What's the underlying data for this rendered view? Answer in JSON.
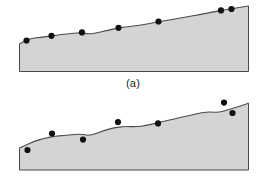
{
  "figure": {
    "background_color": "#ffffff",
    "terrain_fill_color": "#d4d4d4",
    "terrain_outline_color": "#4a4a4a",
    "dot_color": "#111111",
    "dot_radius": 3.1,
    "caption_color": "#1c1c1c",
    "panels": [
      {
        "id": "a",
        "caption": "(a)",
        "name": "terrain-profile-panel-a",
        "description": "Shaded terrain cross-section with sample points lying exactly on the surface profile",
        "view_box": "0 0 266 98",
        "baseline_y": 71.5,
        "left_x": 19.5,
        "right_x": 248.5,
        "profile_points": [
          [
            19.5,
            44.0
          ],
          [
            25.0,
            41.0
          ],
          [
            32.0,
            38.2
          ],
          [
            40.0,
            37.4
          ],
          [
            52.0,
            35.8
          ],
          [
            61.0,
            34.6
          ],
          [
            72.0,
            33.4
          ],
          [
            81.0,
            32.6
          ],
          [
            88.0,
            34.0
          ],
          [
            95.0,
            33.4
          ],
          [
            108.0,
            30.2
          ],
          [
            118.0,
            28.0
          ],
          [
            125.0,
            27.0
          ],
          [
            138.0,
            25.6
          ],
          [
            150.0,
            23.4
          ],
          [
            160.0,
            21.6
          ],
          [
            172.0,
            19.4
          ],
          [
            186.0,
            17.0
          ],
          [
            200.0,
            14.6
          ],
          [
            212.0,
            12.2
          ],
          [
            224.0,
            10.0
          ],
          [
            236.0,
            8.0
          ],
          [
            248.5,
            6.0
          ]
        ],
        "sample_points": [
          {
            "x": 26.5,
            "y": 40.5,
            "label": "sample-point-1"
          },
          {
            "x": 51.5,
            "y": 35.8,
            "label": "sample-point-2"
          },
          {
            "x": 82.0,
            "y": 32.4,
            "label": "sample-point-3"
          },
          {
            "x": 118.5,
            "y": 27.8,
            "label": "sample-point-4"
          },
          {
            "x": 158.5,
            "y": 21.5,
            "label": "sample-point-5"
          },
          {
            "x": 221.0,
            "y": 10.4,
            "label": "sample-point-6"
          },
          {
            "x": 231.5,
            "y": 9.0,
            "label": "sample-point-7"
          }
        ]
      },
      {
        "id": "b",
        "caption": "(b)",
        "name": "terrain-profile-panel-b",
        "description": "Shaded terrain cross-section with sample points scattered above and below the surface profile",
        "view_box": "0 0 266 98",
        "baseline_y": 72.0,
        "left_x": 19.5,
        "right_x": 248.5,
        "profile_points": [
          [
            19.5,
            50.0
          ],
          [
            26.0,
            47.0
          ],
          [
            34.0,
            43.4
          ],
          [
            44.0,
            40.4
          ],
          [
            54.0,
            38.4
          ],
          [
            64.0,
            37.4
          ],
          [
            74.0,
            36.6
          ],
          [
            82.0,
            36.0
          ],
          [
            88.0,
            37.6
          ],
          [
            95.0,
            36.0
          ],
          [
            104.0,
            32.4
          ],
          [
            114.0,
            29.8
          ],
          [
            124.0,
            28.4
          ],
          [
            136.0,
            28.8
          ],
          [
            146.0,
            27.6
          ],
          [
            156.0,
            25.2
          ],
          [
            168.0,
            22.4
          ],
          [
            180.0,
            19.6
          ],
          [
            192.0,
            17.0
          ],
          [
            202.0,
            14.6
          ],
          [
            210.0,
            13.8
          ],
          [
            218.0,
            14.6
          ],
          [
            228.0,
            12.0
          ],
          [
            238.0,
            8.6
          ],
          [
            248.5,
            5.2
          ]
        ],
        "sample_points": [
          {
            "x": 27.5,
            "y": 52.0,
            "label": "sample-point-1"
          },
          {
            "x": 52.0,
            "y": 35.6,
            "label": "sample-point-2"
          },
          {
            "x": 83.0,
            "y": 41.6,
            "label": "sample-point-3"
          },
          {
            "x": 118.0,
            "y": 24.0,
            "label": "sample-point-4"
          },
          {
            "x": 158.0,
            "y": 25.4,
            "label": "sample-point-5"
          },
          {
            "x": 224.0,
            "y": 4.6,
            "label": "sample-point-6"
          },
          {
            "x": 232.5,
            "y": 15.0,
            "label": "sample-point-7"
          }
        ]
      }
    ]
  },
  "chart_data": {
    "type": "line",
    "title": "",
    "subtitle": "",
    "xlabel": "",
    "ylabel": "",
    "grid": false,
    "legend": "none",
    "note": "Two stacked terrain cross-section diagrams. Y values are given as surface height above the flat base line (larger = higher terrain); X is horizontal distance across the profile.",
    "panels": [
      {
        "name": "(a)",
        "xlim": [
          0,
          229
        ],
        "ylim": [
          0,
          70
        ],
        "series": [
          {
            "name": "terrain surface (a)",
            "x": [
              0,
              5.5,
              12.5,
              20.5,
              32.5,
              41.5,
              52.5,
              61.5,
              68.5,
              75.5,
              88.5,
              98.5,
              105.5,
              118.5,
              130.5,
              140.5,
              152.5,
              166.5,
              180.5,
              192.5,
              204.5,
              216.5,
              229
            ],
            "y": [
              27.5,
              30.5,
              33.3,
              34.1,
              35.7,
              36.9,
              38.1,
              38.9,
              37.5,
              38.1,
              41.3,
              43.5,
              44.5,
              45.9,
              48.1,
              49.9,
              52.1,
              54.5,
              56.9,
              59.3,
              61.5,
              63.5,
              65.5
            ]
          },
          {
            "name": "sample points (a)",
            "x": [
              7.0,
              32.0,
              62.5,
              99.0,
              139.0,
              201.5,
              212.0
            ],
            "y": [
              31.0,
              35.7,
              39.1,
              43.7,
              50.0,
              61.1,
              62.5
            ]
          }
        ]
      },
      {
        "name": "(b)",
        "xlim": [
          0,
          229
        ],
        "ylim": [
          0,
          70
        ],
        "series": [
          {
            "name": "terrain surface (b)",
            "x": [
              0,
              6.5,
              14.5,
              24.5,
              34.5,
              44.5,
              54.5,
              62.5,
              68.5,
              75.5,
              84.5,
              94.5,
              104.5,
              116.5,
              126.5,
              136.5,
              148.5,
              160.5,
              172.5,
              182.5,
              190.5,
              198.5,
              208.5,
              218.5,
              229
            ],
            "y": [
              22.0,
              25.0,
              28.6,
              31.6,
              33.6,
              34.6,
              35.4,
              36.0,
              34.4,
              36.0,
              39.6,
              42.2,
              43.6,
              43.2,
              44.4,
              46.8,
              49.6,
              52.4,
              55.0,
              57.4,
              58.2,
              57.4,
              60.0,
              63.4,
              66.8
            ]
          },
          {
            "name": "sample points (b)",
            "x": [
              8.0,
              32.5,
              63.5,
              98.5,
              138.5,
              204.5,
              213.0
            ],
            "y": [
              20.0,
              36.4,
              30.4,
              48.0,
              46.6,
              67.4,
              57.0
            ]
          }
        ]
      }
    ]
  }
}
